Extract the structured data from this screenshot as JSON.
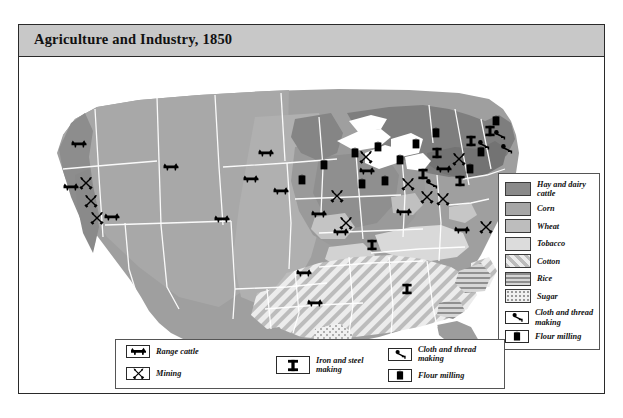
{
  "title": "Agriculture and Industry, 1850",
  "legend": {
    "area_items": [
      {
        "label": "Hay and dairy cattle",
        "pattern": "solid",
        "color": "#8a8a8a"
      },
      {
        "label": "Corn",
        "pattern": "solid",
        "color": "#a6a6a6"
      },
      {
        "label": "Wheat",
        "pattern": "solid",
        "color": "#bdbdbd"
      },
      {
        "label": "Tobacco",
        "pattern": "solid",
        "color": "#dcdcdc"
      },
      {
        "label": "Cotton",
        "pattern": "diagonal-stripes",
        "color": "#e8e8e8"
      },
      {
        "label": "Rice",
        "pattern": "horizontal-lines",
        "color": "#cfcfcf"
      },
      {
        "label": "Sugar",
        "pattern": "dots",
        "color": "#efefef"
      }
    ],
    "symbol_items": [
      {
        "label": "Range cattle",
        "icon": "cattle-icon"
      },
      {
        "label": "Mining",
        "icon": "crossed-pick-hammer-icon"
      },
      {
        "label": "Iron and steel making",
        "icon": "i-beam-icon"
      },
      {
        "label": "Cloth and thread making",
        "icon": "spindle-icon"
      },
      {
        "label": "Flour milling",
        "icon": "flour-sack-icon"
      }
    ]
  },
  "map": {
    "water_color": "#ffffff",
    "border_color": "#ffffff",
    "symbols": {
      "cattle": [
        {
          "x": 60,
          "y": 87
        },
        {
          "x": 152,
          "y": 110
        },
        {
          "x": 52,
          "y": 130
        },
        {
          "x": 203,
          "y": 162
        },
        {
          "x": 93,
          "y": 160
        },
        {
          "x": 232,
          "y": 122
        },
        {
          "x": 285,
          "y": 216
        },
        {
          "x": 296,
          "y": 246
        },
        {
          "x": 247,
          "y": 96
        },
        {
          "x": 262,
          "y": 134
        },
        {
          "x": 300,
          "y": 157
        },
        {
          "x": 322,
          "y": 175
        },
        {
          "x": 348,
          "y": 114
        },
        {
          "x": 385,
          "y": 155
        },
        {
          "x": 425,
          "y": 112
        },
        {
          "x": 443,
          "y": 173
        }
      ],
      "mining": [
        {
          "x": 67,
          "y": 126
        },
        {
          "x": 72,
          "y": 144
        },
        {
          "x": 78,
          "y": 161
        },
        {
          "x": 318,
          "y": 139
        },
        {
          "x": 327,
          "y": 166
        },
        {
          "x": 347,
          "y": 100
        },
        {
          "x": 389,
          "y": 127
        },
        {
          "x": 408,
          "y": 140
        },
        {
          "x": 424,
          "y": 142
        },
        {
          "x": 440,
          "y": 102
        },
        {
          "x": 467,
          "y": 170
        }
      ],
      "iron_steel": [
        {
          "x": 353,
          "y": 188
        },
        {
          "x": 404,
          "y": 117
        },
        {
          "x": 418,
          "y": 96
        },
        {
          "x": 441,
          "y": 124
        },
        {
          "x": 452,
          "y": 84
        },
        {
          "x": 471,
          "y": 74
        },
        {
          "x": 388,
          "y": 232
        }
      ],
      "flour_mill": [
        {
          "x": 283,
          "y": 123
        },
        {
          "x": 305,
          "y": 108
        },
        {
          "x": 336,
          "y": 96
        },
        {
          "x": 343,
          "y": 127
        },
        {
          "x": 359,
          "y": 90
        },
        {
          "x": 366,
          "y": 124
        },
        {
          "x": 381,
          "y": 103
        },
        {
          "x": 397,
          "y": 87
        },
        {
          "x": 417,
          "y": 76
        },
        {
          "x": 451,
          "y": 112
        },
        {
          "x": 462,
          "y": 95
        },
        {
          "x": 477,
          "y": 64
        }
      ],
      "cloth": [
        {
          "x": 464,
          "y": 88
        },
        {
          "x": 480,
          "y": 78
        },
        {
          "x": 487,
          "y": 92
        },
        {
          "x": 412,
          "y": 127
        }
      ]
    }
  }
}
